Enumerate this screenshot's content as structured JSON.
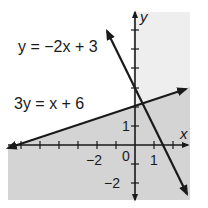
{
  "figure": {
    "type": "system-of-linear-inequalities-graph",
    "equations": [
      {
        "id": "line1",
        "label": "y = −2x + 3",
        "slope": -2,
        "intercept": 3
      },
      {
        "id": "line2",
        "label": "3y =  x + 6",
        "slope": 0.3333,
        "intercept": 2
      }
    ],
    "axes": {
      "x_label": "x",
      "y_label": "y",
      "x_ticks_labeled": [
        {
          "value": -2,
          "label": "−2"
        },
        {
          "value": 0,
          "label": "0"
        },
        {
          "value": 1,
          "label": "1"
        }
      ],
      "y_ticks_labeled": [
        {
          "value": 1,
          "label": "1"
        },
        {
          "value": -2,
          "label": "−2"
        }
      ]
    },
    "shading": {
      "region": "below 3y = x + 6",
      "color": "#d6d6d6",
      "background_color": "#eeeeee"
    },
    "colors": {
      "line": "#1a1a1a",
      "axis": "#1a1a1a"
    }
  }
}
